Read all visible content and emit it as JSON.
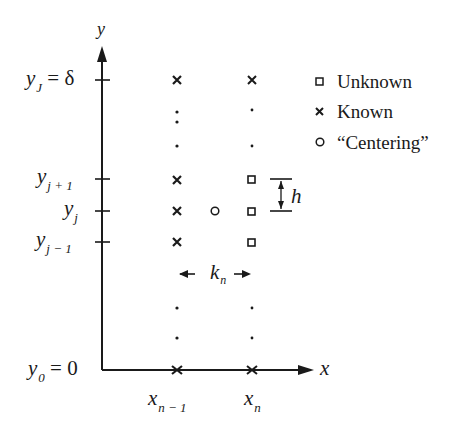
{
  "axes": {
    "x_label": "x",
    "y_label": "y"
  },
  "y_ticks": [
    {
      "main": "y",
      "sub": "J",
      "suffix": " = δ"
    },
    {
      "main": "y",
      "sub": "j + 1",
      "suffix": ""
    },
    {
      "main": "y",
      "sub": "j",
      "suffix": ""
    },
    {
      "main": "y",
      "sub": "j − 1",
      "suffix": ""
    },
    {
      "main": "y",
      "sub": "0",
      "suffix": " = 0"
    }
  ],
  "x_ticks": [
    {
      "main": "x",
      "sub": "n − 1"
    },
    {
      "main": "x",
      "sub": "n"
    }
  ],
  "legend": {
    "unknown": "Unknown",
    "known": "Known",
    "centering": "“Centering”"
  },
  "annotations": {
    "h": "h",
    "k_main": "k",
    "k_sub": "n"
  },
  "colors": {
    "ink": "#1a1a1a",
    "background": "#ffffff"
  }
}
